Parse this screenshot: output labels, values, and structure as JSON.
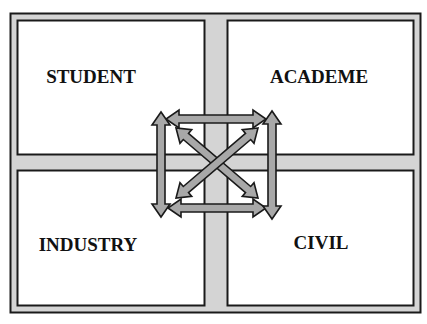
{
  "diagram": {
    "title_cropped": "",
    "quadrants": [
      {
        "id": "top-left",
        "label": "STUDENT"
      },
      {
        "id": "top-right",
        "label": "ACADEME"
      },
      {
        "id": "bottom-left",
        "label": "INDUSTRY"
      },
      {
        "id": "bottom-right",
        "label": "CIVIL"
      }
    ],
    "connections": [
      {
        "from": "STUDENT",
        "to": "ACADEME",
        "type": "bidirectional"
      },
      {
        "from": "INDUSTRY",
        "to": "CIVIL",
        "type": "bidirectional"
      },
      {
        "from": "STUDENT",
        "to": "INDUSTRY",
        "type": "bidirectional"
      },
      {
        "from": "ACADEME",
        "to": "CIVIL",
        "type": "bidirectional"
      },
      {
        "from": "STUDENT",
        "to": "CIVIL",
        "type": "bidirectional"
      },
      {
        "from": "ACADEME",
        "to": "INDUSTRY",
        "type": "bidirectional"
      }
    ],
    "colors": {
      "frame_fill": "#d4d4d4",
      "border": "#1a1a1a",
      "box_fill": "#ffffff",
      "arrow_fill": "#a8a8a8",
      "arrow_stroke": "#1a1a1a"
    }
  }
}
